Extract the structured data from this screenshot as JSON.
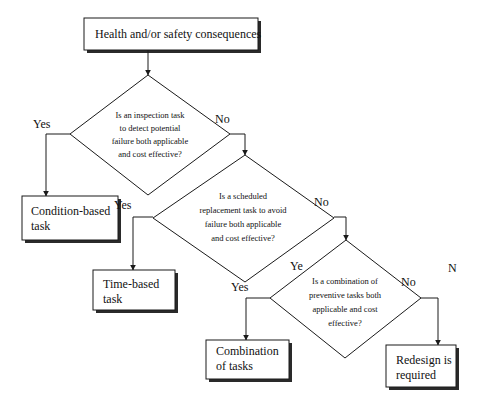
{
  "diagram": {
    "start": {
      "label": "Health and/or safety consequences"
    },
    "decisions": [
      {
        "lines": [
          "Is an inspection task",
          "to detect potential",
          "failure both applicable",
          "and cost effective?"
        ]
      },
      {
        "lines": [
          "Is a scheduled",
          "replacement task to avoid",
          "failure both applicable",
          "and cost effective?"
        ]
      },
      {
        "lines": [
          "Is a combination of",
          "preventive tasks both",
          "applicable and cost",
          "effective?"
        ]
      }
    ],
    "outcomes": [
      {
        "lines": [
          "Condition-based",
          "task"
        ]
      },
      {
        "lines": [
          "Time-based",
          "task"
        ]
      },
      {
        "lines": [
          "Combination",
          "of tasks"
        ]
      },
      {
        "lines": [
          "Redesign is",
          "required"
        ]
      }
    ],
    "edge_labels": {
      "d1_yes": "Yes",
      "d1_no": "No",
      "d2_yes_top": "Yes",
      "d2_yes_bottom": "Yes",
      "d2_no": "No",
      "d3_yes": "Ye",
      "d3_no": "No",
      "stray_n": "N"
    },
    "colors": {
      "line": "#1a1a1a",
      "shadow": "#2a2a2a",
      "fill": "#ffffff"
    }
  }
}
